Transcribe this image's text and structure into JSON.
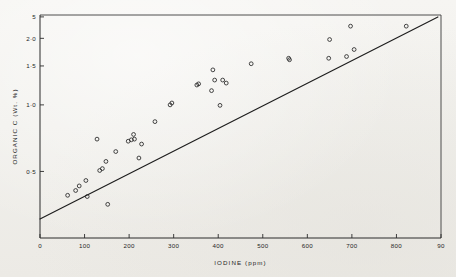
{
  "figure": {
    "name": "organic-carbon-vs-iodine-scatter",
    "background_color": "#f3f2ef",
    "ink_color": "#1f1f1f"
  },
  "chart_data": {
    "type": "scatter",
    "title": "",
    "xlabel": "IODINE (ppm)",
    "ylabel": "ORGANIC  C  (Wt. %)",
    "xlim": [
      0,
      900
    ],
    "ylim": [
      0.25,
      2.55
    ],
    "yscale": "log",
    "xscale": "linear",
    "grid": false,
    "legend": null,
    "xticks": [
      0,
      100,
      200,
      300,
      400,
      500,
      600,
      700,
      800,
      900
    ],
    "xticklabels": [
      "0",
      "100",
      "200",
      "300",
      "400",
      "500",
      "600",
      "700",
      "800",
      "90"
    ],
    "yticks": [
      0.5,
      1.0,
      1.5,
      2.0,
      2.5
    ],
    "yticklabels": [
      "0·5",
      "1·0",
      "1·5",
      "2·0",
      "5"
    ],
    "series": [
      {
        "name": "samples",
        "marker": "open-circle",
        "points": [
          [
            62,
            0.39
          ],
          [
            80,
            0.41
          ],
          [
            88,
            0.43
          ],
          [
            103,
            0.455
          ],
          [
            106,
            0.385
          ],
          [
            128,
            0.7
          ],
          [
            134,
            0.505
          ],
          [
            140,
            0.515
          ],
          [
            148,
            0.555
          ],
          [
            152,
            0.355
          ],
          [
            170,
            0.615
          ],
          [
            198,
            0.685
          ],
          [
            205,
            0.695
          ],
          [
            210,
            0.735
          ],
          [
            212,
            0.7
          ],
          [
            222,
            0.575
          ],
          [
            228,
            0.665
          ],
          [
            258,
            0.84
          ],
          [
            292,
            1.0
          ],
          [
            296,
            1.02
          ],
          [
            352,
            1.23
          ],
          [
            356,
            1.245
          ],
          [
            385,
            1.16
          ],
          [
            388,
            1.44
          ],
          [
            392,
            1.295
          ],
          [
            404,
            0.995
          ],
          [
            410,
            1.295
          ],
          [
            418,
            1.255
          ],
          [
            474,
            1.535
          ],
          [
            558,
            1.625
          ],
          [
            560,
            1.6
          ],
          [
            648,
            1.625
          ],
          [
            650,
            1.975
          ],
          [
            688,
            1.655
          ],
          [
            697,
            2.27
          ],
          [
            705,
            1.78
          ],
          [
            822,
            2.27
          ]
        ]
      }
    ],
    "fit_line": {
      "name": "regression-line",
      "x_start": 0,
      "y_start": 0.305,
      "x_end": 893,
      "y_end": 2.5
    }
  }
}
